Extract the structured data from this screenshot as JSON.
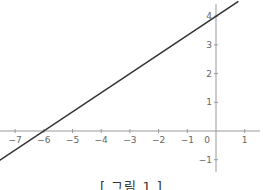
{
  "chart_data": {
    "type": "line",
    "title": "",
    "caption": "[ 그림 1 ]",
    "xlabel": "",
    "ylabel": "",
    "xlim": [
      -7.5,
      1.6
    ],
    "ylim": [
      -1.5,
      4.5
    ],
    "grid": false,
    "x_ticks": [
      -7,
      -6,
      -5,
      -4,
      -3,
      -2,
      -1,
      0,
      1
    ],
    "y_ticks": [
      -1,
      1,
      2,
      3,
      4
    ],
    "x_tick_labels": [
      "−7",
      "−6",
      "−5",
      "−4",
      "−3",
      "−2",
      "−1",
      "0",
      "1"
    ],
    "y_tick_labels": [
      "−1",
      "1",
      "2",
      "3",
      "4"
    ],
    "series": [
      {
        "name": "line",
        "equation": "y = (2/3)x + 4",
        "x": [
          -7.55,
          0.78
        ],
        "y": [
          -1.03,
          4.52
        ],
        "color": "#333333"
      }
    ],
    "axis_color": "#999999"
  }
}
